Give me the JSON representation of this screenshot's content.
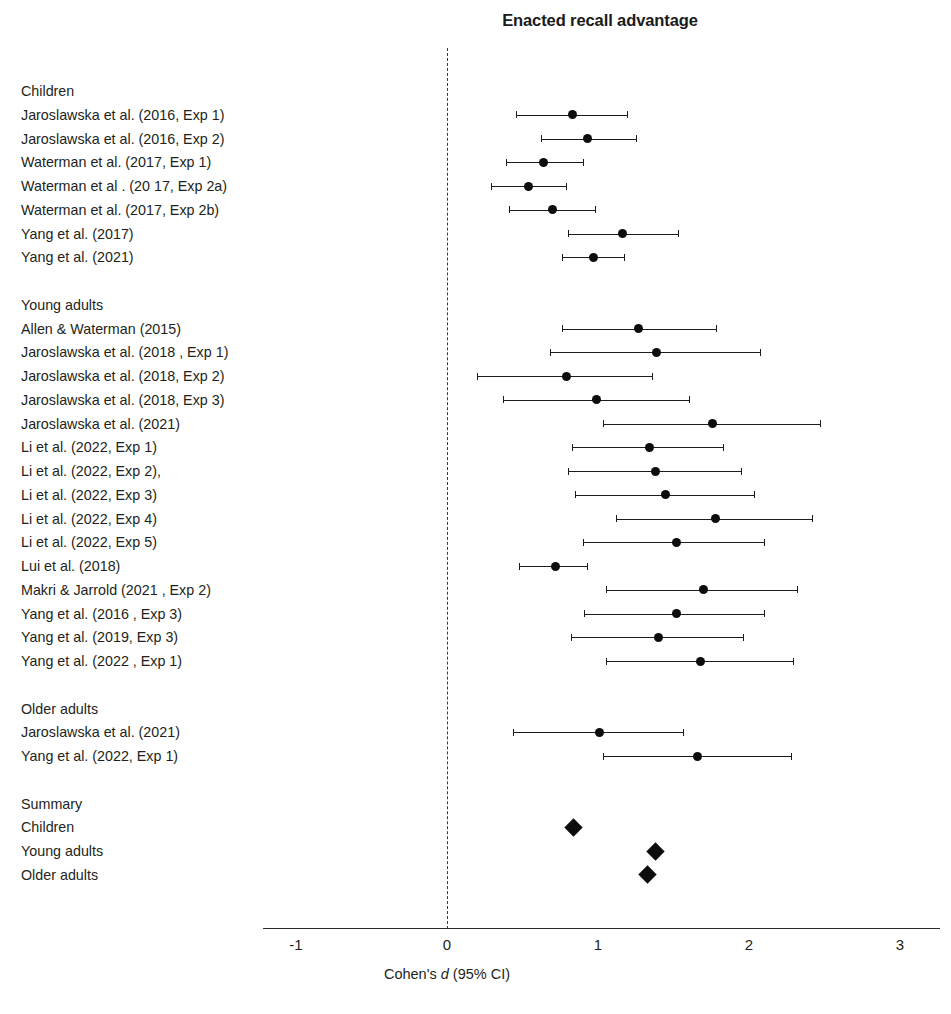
{
  "chart_data": {
    "type": "scatter",
    "title": "Enacted recall advantage",
    "xlabel": "Cohen's d (95% CI)",
    "ylabel": "",
    "xlim": [
      -1.35,
      3.27
    ],
    "xticks": [
      -1,
      0,
      1,
      2,
      3
    ],
    "xtick_labels": [
      "-1",
      "0",
      "1",
      "2",
      "3"
    ],
    "grid": false,
    "legend": "none",
    "reference_line": 0,
    "reference_line_style": "dashed",
    "effect_measure": "Cohen's d",
    "ci_level": "95% CI",
    "rows": [
      {
        "label": "Children",
        "kind": "group-header"
      },
      {
        "label": "Jaroslawska et al. (2016, Exp 1)",
        "kind": "study",
        "d": 0.83,
        "ci_low": 0.46,
        "ci_high": 1.19
      },
      {
        "label": "Jaroslawska et al. (2016, Exp 2)",
        "kind": "study",
        "d": 0.93,
        "ci_low": 0.62,
        "ci_high": 1.25
      },
      {
        "label": "Waterman et al. (2017, Exp 1)",
        "kind": "study",
        "d": 0.64,
        "ci_low": 0.39,
        "ci_high": 0.9
      },
      {
        "label": "Waterman et al . (20 17, Exp 2a)",
        "kind": "study",
        "d": 0.54,
        "ci_low": 0.29,
        "ci_high": 0.79
      },
      {
        "label": "Waterman et al. (2017, Exp 2b)",
        "kind": "study",
        "d": 0.7,
        "ci_low": 0.41,
        "ci_high": 0.98
      },
      {
        "label": "Yang et al. (2017)",
        "kind": "study",
        "d": 1.16,
        "ci_low": 0.8,
        "ci_high": 1.53
      },
      {
        "label": "Yang et al. (2021)",
        "kind": "study",
        "d": 0.97,
        "ci_low": 0.76,
        "ci_high": 1.17
      },
      {
        "label": "",
        "kind": "spacer"
      },
      {
        "label": "Young adults",
        "kind": "group-header"
      },
      {
        "label": "Allen & Waterman (2015)",
        "kind": "study",
        "d": 1.27,
        "ci_low": 0.76,
        "ci_high": 1.78
      },
      {
        "label": "Jaroslawska et al. (2018 , Exp 1)",
        "kind": "study",
        "d": 1.39,
        "ci_low": 0.68,
        "ci_high": 2.07
      },
      {
        "label": "Jaroslawska et al. (2018, Exp 2)",
        "kind": "study",
        "d": 0.79,
        "ci_low": 0.2,
        "ci_high": 1.36
      },
      {
        "label": "Jaroslawska et al. (2018, Exp 3)",
        "kind": "study",
        "d": 0.99,
        "ci_low": 0.37,
        "ci_high": 1.6
      },
      {
        "label": "Jaroslawska et al. (2021)",
        "kind": "study",
        "d": 1.76,
        "ci_low": 1.03,
        "ci_high": 2.47
      },
      {
        "label": "Li et al. (2022, Exp 1)",
        "kind": "study",
        "d": 1.34,
        "ci_low": 0.83,
        "ci_high": 1.83
      },
      {
        "label": "Li et al. (2022, Exp 2),",
        "kind": "study",
        "d": 1.38,
        "ci_low": 0.8,
        "ci_high": 1.95
      },
      {
        "label": "Li et al. (2022, Exp 3)",
        "kind": "study",
        "d": 1.45,
        "ci_low": 0.85,
        "ci_high": 2.03
      },
      {
        "label": "Li et al. (2022, Exp 4)",
        "kind": "study",
        "d": 1.78,
        "ci_low": 1.12,
        "ci_high": 2.42
      },
      {
        "label": "Li et al. (2022, Exp 5)",
        "kind": "study",
        "d": 1.52,
        "ci_low": 0.9,
        "ci_high": 2.1
      },
      {
        "label": "Lui et al. (2018)",
        "kind": "study",
        "d": 0.72,
        "ci_low": 0.48,
        "ci_high": 0.93
      },
      {
        "label": "Makri & Jarrold (2021 , Exp 2)",
        "kind": "study",
        "d": 1.7,
        "ci_low": 1.05,
        "ci_high": 2.32
      },
      {
        "label": "Yang et al. (2016 , Exp 3)",
        "kind": "study",
        "d": 1.52,
        "ci_low": 0.91,
        "ci_high": 2.1
      },
      {
        "label": "Yang et al. (2019, Exp 3)",
        "kind": "study",
        "d": 1.4,
        "ci_low": 0.82,
        "ci_high": 1.96
      },
      {
        "label": "Yang et al. (2022 , Exp 1)",
        "kind": "study",
        "d": 1.68,
        "ci_low": 1.05,
        "ci_high": 2.29
      },
      {
        "label": "",
        "kind": "spacer"
      },
      {
        "label": "Older adults",
        "kind": "group-header"
      },
      {
        "label": "Jaroslawska et al. (2021)",
        "kind": "study",
        "d": 1.01,
        "ci_low": 0.44,
        "ci_high": 1.56
      },
      {
        "label": "Yang et al. (2022, Exp 1)",
        "kind": "study",
        "d": 1.66,
        "ci_low": 1.03,
        "ci_high": 2.28
      },
      {
        "label": "",
        "kind": "spacer"
      },
      {
        "label": "Summary",
        "kind": "group-header"
      },
      {
        "label": "Children",
        "kind": "summary",
        "d": 0.84
      },
      {
        "label": "Young adults",
        "kind": "summary",
        "d": 1.38
      },
      {
        "label": "Older adults",
        "kind": "summary",
        "d": 1.33
      }
    ]
  },
  "colors": {
    "marker": "#0d0d0d",
    "line": "#1c1c1c",
    "axis": "#2b2b2b",
    "text": "#231f20",
    "reference": "#3a3a3a",
    "background": "#ffffff"
  },
  "bottom_caption": ""
}
